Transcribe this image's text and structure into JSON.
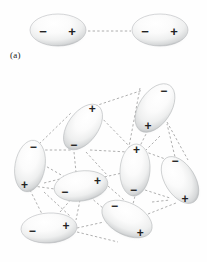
{
  "figure": {
    "background_color": "#fefefe",
    "panels": [
      {
        "id": "a",
        "label": "(a)",
        "label_x": 10,
        "label_y": 50,
        "description": "Two aligned electric dipoles joined by a dashed interaction line"
      },
      {
        "id": "b",
        "label": "",
        "description": "Cluster of nine electric dipoles interconnected by dashed interaction lines"
      }
    ],
    "signs": {
      "negative": "−",
      "positive": "+"
    },
    "colors": {
      "ellipse_light": "#ffffff",
      "ellipse_mid": "#eceded",
      "ellipse_edge": "#b8bbbd",
      "ellipse_shadow": "#c9cbcc",
      "dash_line": "#9a9a9a",
      "sign_text": "#222222",
      "label_text": "#1a1a1a"
    },
    "dipoles_panel_a": [
      {
        "name": "dipole-a-left",
        "cx": 58,
        "cy": 30,
        "rx": 28,
        "ry": 16,
        "rot": 0,
        "minus": {
          "dx": -15,
          "dy": 1
        },
        "plus": {
          "dx": 14,
          "dy": 1
        },
        "sign_size": 13
      },
      {
        "name": "dipole-a-right",
        "cx": 160,
        "cy": 30,
        "rx": 28,
        "ry": 16,
        "rot": 0,
        "minus": {
          "dx": -15,
          "dy": 1
        },
        "plus": {
          "dx": 14,
          "dy": 1
        },
        "sign_size": 13
      }
    ],
    "links_panel_a": [
      {
        "x1": 88,
        "y1": 31,
        "x2": 131,
        "y2": 31
      }
    ],
    "dipoles_panel_b": [
      {
        "name": "dipole-b-top-right",
        "cx": 155,
        "cy": 108,
        "rx": 16,
        "ry": 27,
        "rot": 33,
        "minus": {
          "dx": -2,
          "dy": -19
        },
        "plus": {
          "dx": 4,
          "dy": 19
        },
        "sign_size": 12
      },
      {
        "name": "dipole-b-top-center",
        "cx": 83,
        "cy": 127,
        "rx": 15,
        "ry": 26,
        "rot": 36,
        "minus": {
          "dx": 3,
          "dy": 20
        },
        "plus": {
          "dx": -3,
          "dy": -20
        },
        "sign_size": 12
      },
      {
        "name": "dipole-b-left-upper",
        "cx": 30,
        "cy": 166,
        "rx": 15,
        "ry": 26,
        "rot": 10,
        "minus": {
          "dx": 0,
          "dy": -19
        },
        "plus": {
          "dx": -2,
          "dy": 20
        },
        "sign_size": 12
      },
      {
        "name": "dipole-b-center",
        "cx": 135,
        "cy": 170,
        "rx": 15,
        "ry": 26,
        "rot": 4,
        "minus": {
          "dx": 0,
          "dy": 20
        },
        "plus": {
          "dx": 0,
          "dy": -20
        },
        "sign_size": 12
      },
      {
        "name": "dipole-b-right",
        "cx": 180,
        "cy": 180,
        "rx": 15,
        "ry": 26,
        "rot": -32,
        "minus": {
          "dx": 6,
          "dy": -19
        },
        "plus": {
          "dx": -6,
          "dy": 19
        },
        "sign_size": 12
      },
      {
        "name": "dipole-b-middle",
        "cx": 81,
        "cy": 186,
        "rx": 27,
        "ry": 15,
        "rot": -8,
        "minus": {
          "dx": -17,
          "dy": 4
        },
        "plus": {
          "dx": 17,
          "dy": -3
        },
        "sign_size": 12
      },
      {
        "name": "dipole-b-bottom-center",
        "cx": 127,
        "cy": 219,
        "rx": 27,
        "ry": 16,
        "rot": 27,
        "minus": {
          "dx": -17,
          "dy": -6
        },
        "plus": {
          "dx": 18,
          "dy": 6
        },
        "sign_size": 12
      },
      {
        "name": "dipole-b-bottom-left",
        "cx": 49,
        "cy": 228,
        "rx": 28,
        "ry": 15,
        "rot": -3,
        "minus": {
          "dx": -17,
          "dy": 2
        },
        "plus": {
          "dx": 17,
          "dy": -1
        },
        "sign_size": 12
      }
    ],
    "links_panel_b": [
      {
        "x1": 36,
        "y1": 147,
        "x2": 72,
        "y2": 112
      },
      {
        "x1": 95,
        "y1": 106,
        "x2": 143,
        "y2": 90
      },
      {
        "x1": 140,
        "y1": 88,
        "x2": 128,
        "y2": 152
      },
      {
        "x1": 94,
        "y1": 110,
        "x2": 133,
        "y2": 150
      },
      {
        "x1": 167,
        "y1": 122,
        "x2": 188,
        "y2": 160
      },
      {
        "x1": 148,
        "y1": 130,
        "x2": 138,
        "y2": 150
      },
      {
        "x1": 36,
        "y1": 150,
        "x2": 72,
        "y2": 150
      },
      {
        "x1": 35,
        "y1": 160,
        "x2": 70,
        "y2": 180
      },
      {
        "x1": 33,
        "y1": 186,
        "x2": 62,
        "y2": 190
      },
      {
        "x1": 30,
        "y1": 190,
        "x2": 42,
        "y2": 214
      },
      {
        "x1": 44,
        "y1": 192,
        "x2": 70,
        "y2": 216
      },
      {
        "x1": 74,
        "y1": 152,
        "x2": 76,
        "y2": 172
      },
      {
        "x1": 86,
        "y1": 152,
        "x2": 108,
        "y2": 176
      },
      {
        "x1": 90,
        "y1": 150,
        "x2": 128,
        "y2": 152
      },
      {
        "x1": 100,
        "y1": 178,
        "x2": 122,
        "y2": 173
      },
      {
        "x1": 108,
        "y1": 186,
        "x2": 124,
        "y2": 200
      },
      {
        "x1": 80,
        "y1": 200,
        "x2": 76,
        "y2": 220
      },
      {
        "x1": 90,
        "y1": 197,
        "x2": 110,
        "y2": 214
      },
      {
        "x1": 77,
        "y1": 228,
        "x2": 104,
        "y2": 222
      },
      {
        "x1": 77,
        "y1": 232,
        "x2": 118,
        "y2": 242
      },
      {
        "x1": 60,
        "y1": 212,
        "x2": 74,
        "y2": 196
      },
      {
        "x1": 136,
        "y1": 192,
        "x2": 133,
        "y2": 204
      },
      {
        "x1": 145,
        "y1": 190,
        "x2": 170,
        "y2": 198
      },
      {
        "x1": 152,
        "y1": 202,
        "x2": 170,
        "y2": 200
      },
      {
        "x1": 148,
        "y1": 214,
        "x2": 176,
        "y2": 203
      },
      {
        "x1": 168,
        "y1": 160,
        "x2": 146,
        "y2": 152
      },
      {
        "x1": 160,
        "y1": 136,
        "x2": 146,
        "y2": 150
      },
      {
        "x1": 176,
        "y1": 161,
        "x2": 167,
        "y2": 124
      },
      {
        "x1": 44,
        "y1": 183,
        "x2": 64,
        "y2": 178
      }
    ]
  }
}
